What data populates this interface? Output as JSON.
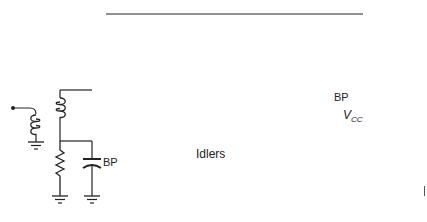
{
  "diagram": {
    "type": "circuit-schematic",
    "labels": {
      "bypass_cap_input": "BP",
      "bypass_cap_output": "BP",
      "supply": "V",
      "supply_subscript": "CC",
      "idlers": "Idlers"
    },
    "components": [
      {
        "id": "input-terminal",
        "kind": "terminal"
      },
      {
        "id": "input-coil",
        "kind": "inductor"
      },
      {
        "id": "transformer-secondary",
        "kind": "inductor"
      },
      {
        "id": "bias-resistor",
        "kind": "resistor"
      },
      {
        "id": "bypass-capacitor-input",
        "kind": "capacitor",
        "label": "BP"
      },
      {
        "id": "transistor",
        "kind": "npn-bjt"
      },
      {
        "id": "idler-1",
        "kind": "series-LC",
        "parts": [
          "variable-capacitor",
          "inductor"
        ]
      },
      {
        "id": "idler-2",
        "kind": "series-LC",
        "parts": [
          "variable-capacitor",
          "inductor"
        ]
      },
      {
        "id": "idler-3",
        "kind": "series-LC",
        "parts": [
          "variable-capacitor",
          "inductor"
        ]
      },
      {
        "id": "output-tank-capacitor",
        "kind": "variable-capacitor"
      },
      {
        "id": "output-tank-coil",
        "kind": "inductor"
      },
      {
        "id": "bypass-capacitor-output",
        "kind": "capacitor",
        "label": "BP"
      },
      {
        "id": "vcc-supply",
        "kind": "supply",
        "label": "VCC"
      },
      {
        "id": "output-coil",
        "kind": "inductor"
      },
      {
        "id": "output-terminal",
        "kind": "terminal"
      }
    ],
    "colors": {
      "stroke": "#222222",
      "background": "#ffffff"
    }
  }
}
